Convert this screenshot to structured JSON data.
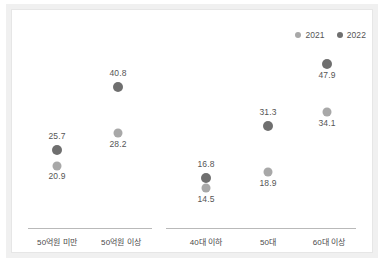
{
  "chart_data": {
    "type": "scatter",
    "title": "",
    "subtitle": "",
    "xlabel": "",
    "ylabel": "",
    "grid": false,
    "legend_position": "top-right",
    "ylim": [
      10,
      52
    ],
    "categories": [
      "50억원 미만",
      "50억원 이상",
      "40대 이하",
      "50대",
      "60대 이상"
    ],
    "category_groups": [
      {
        "name": "매출액",
        "categories": [
          "50억원 미만",
          "50억원 이상"
        ]
      },
      {
        "name": "연령",
        "categories": [
          "40대 이하",
          "50대",
          "60대 이상"
        ]
      }
    ],
    "series": [
      {
        "name": "2021",
        "color": "#a8a8a8",
        "values": [
          20.9,
          28.2,
          14.5,
          18.9,
          34.1
        ]
      },
      {
        "name": "2022",
        "color": "#6f6f6f",
        "values": [
          25.7,
          40.8,
          16.8,
          31.3,
          47.9
        ]
      }
    ],
    "point_labels": {
      "2021": [
        "20.9",
        "28.2",
        "14.5",
        "18.9",
        "34.1"
      ],
      "2022": [
        "25.7",
        "40.8",
        "16.8",
        "31.3",
        "47.9"
      ]
    }
  },
  "legend": {
    "items": [
      {
        "label": "2021",
        "color": "#a8a8a8"
      },
      {
        "label": "2022",
        "color": "#6f6f6f"
      }
    ]
  },
  "axis": {
    "categories": [
      {
        "label": "50억원 미만"
      },
      {
        "label": "50억원 이상"
      },
      {
        "label": "40대 이하"
      },
      {
        "label": "50대"
      },
      {
        "label": "60대 이상"
      }
    ]
  },
  "points": [
    {
      "category": "50억원 미만",
      "series": "2021",
      "value": "20.9",
      "x": 57,
      "y": 166,
      "label_y": 171,
      "label_pos": "below"
    },
    {
      "category": "50억원 미만",
      "series": "2022",
      "value": "25.7",
      "x": 57,
      "y": 150,
      "label_y": 131,
      "label_pos": "above"
    },
    {
      "category": "50억원 이상",
      "series": "2021",
      "value": "28.2",
      "x": 118,
      "y": 133,
      "label_y": 139,
      "label_pos": "below"
    },
    {
      "category": "50억원 이상",
      "series": "2022",
      "value": "40.8",
      "x": 118,
      "y": 87,
      "label_y": 68,
      "label_pos": "above"
    },
    {
      "category": "40대 이하",
      "series": "2021",
      "value": "14.5",
      "x": 206,
      "y": 188,
      "label_y": 194,
      "label_pos": "below"
    },
    {
      "category": "40대 이하",
      "series": "2022",
      "value": "16.8",
      "x": 206,
      "y": 178,
      "label_y": 159,
      "label_pos": "above"
    },
    {
      "category": "50대",
      "series": "2021",
      "value": "18.9",
      "x": 268,
      "y": 172,
      "label_y": 178,
      "label_pos": "below"
    },
    {
      "category": "50대",
      "series": "2022",
      "value": "31.3",
      "x": 268,
      "y": 126,
      "label_y": 107,
      "label_pos": "above"
    },
    {
      "category": "60대 이상",
      "series": "2021",
      "value": "34.1",
      "x": 327,
      "y": 112,
      "label_y": 118,
      "label_pos": "below"
    },
    {
      "category": "60대 이상",
      "series": "2022",
      "value": "47.9",
      "x": 327,
      "y": 64,
      "label_y": 70,
      "label_pos": "below"
    }
  ]
}
